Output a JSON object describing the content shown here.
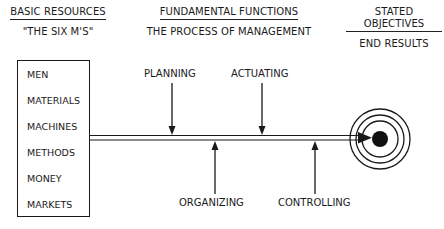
{
  "headers": [
    {
      "title": "BASIC RESOURCES",
      "subtitle": "\"THE SIX M'S\""
    },
    {
      "title": "FUNDAMENTAL FUNCTIONS",
      "subtitle": "THE PROCESS OF MANAGEMENT"
    },
    {
      "title": "STATED OBJECTIVES",
      "subtitle": "END RESULTS"
    }
  ],
  "resources": [
    "MEN",
    "MATERIALS",
    "MACHINES",
    "METHODS",
    "MONEY",
    "MARKETS"
  ],
  "functions": {
    "top": [
      {
        "label": "PLANNING",
        "direction": "down"
      },
      {
        "label": "ACTUATING",
        "direction": "down"
      }
    ],
    "bottom": [
      {
        "label": "ORGANIZING",
        "direction": "up"
      },
      {
        "label": "CONTROLLING",
        "direction": "up"
      }
    ]
  },
  "target": {
    "icon": "bullseye-icon",
    "rings": 3
  },
  "colors": {
    "ink": "#1a1a1a",
    "background": "#ffffff"
  }
}
